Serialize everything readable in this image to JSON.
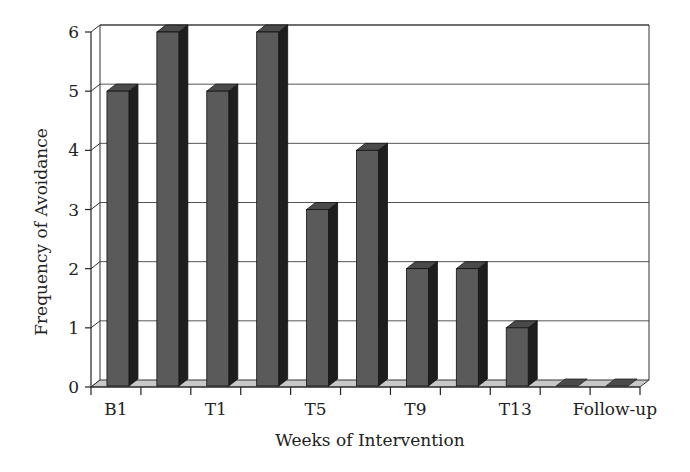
{
  "chart_data": {
    "type": "bar",
    "style": "3d-column",
    "title": "",
    "xlabel": "Weeks of Intervention",
    "ylabel": "Frequency of Avoidance",
    "categories": [
      "B1",
      "",
      "T1",
      "",
      "T5",
      "",
      "T9",
      "",
      "T13",
      "",
      "Follow-up"
    ],
    "values": [
      5,
      6,
      5,
      6,
      3,
      4,
      2,
      2,
      1,
      0,
      0
    ],
    "x_tick_labels": [
      "B1",
      "T1",
      "T5",
      "T9",
      "T13",
      "Follow-up"
    ],
    "y_ticks": [
      0,
      1,
      2,
      3,
      4,
      5,
      6
    ],
    "ylim": [
      0,
      6
    ],
    "grid": true,
    "legend": "none",
    "colors": {
      "bar_front": "#5a5a5a",
      "bar_side": "#1e1e1e",
      "bar_top": "#4a4a4a",
      "floor": "#c8c8c8",
      "grid": "#555555"
    }
  }
}
